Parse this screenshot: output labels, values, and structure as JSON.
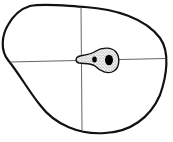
{
  "diagram": {
    "colors": {
      "background": "#ffffff",
      "outline": "#111111",
      "axes": "#555555",
      "stipple_fill": "#d9d9d9",
      "spots": "#000000"
    },
    "elements": {
      "outline": "irregular-closed-shape",
      "vertical_axis": "line",
      "horizontal_axis": "line",
      "region": "stippled-teardrop",
      "spots": [
        "small-spot",
        "large-spot"
      ]
    }
  }
}
